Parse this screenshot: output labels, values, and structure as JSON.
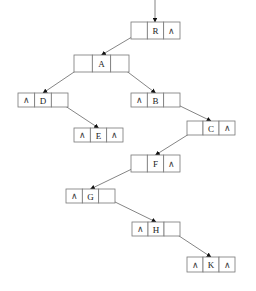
{
  "diagram": {
    "type": "binary-tree-linked-representation",
    "nil_symbol": "∧",
    "root_pointer": {
      "x": 155,
      "y1": 0,
      "y2": 22
    },
    "nodes": [
      {
        "id": "R",
        "label": "R",
        "x": 131,
        "y": 22,
        "w": 49,
        "h": 17,
        "left": "A",
        "right": null
      },
      {
        "id": "A",
        "label": "A",
        "x": 74,
        "y": 55,
        "w": 55,
        "h": 17,
        "left": "D",
        "right": "B"
      },
      {
        "id": "D",
        "label": "D",
        "x": 18,
        "y": 93,
        "w": 50,
        "h": 14,
        "left": null,
        "right": "E"
      },
      {
        "id": "B",
        "label": "B",
        "x": 131,
        "y": 93,
        "w": 49,
        "h": 14,
        "left": null,
        "right": "C"
      },
      {
        "id": "E",
        "label": "E",
        "x": 74,
        "y": 128,
        "w": 49,
        "h": 14,
        "left": null,
        "right": null
      },
      {
        "id": "C",
        "label": "C",
        "x": 187,
        "y": 121,
        "w": 48,
        "h": 14,
        "left": "F",
        "right": null
      },
      {
        "id": "F",
        "label": "F",
        "x": 131,
        "y": 155,
        "w": 49,
        "h": 17,
        "left": "G",
        "right": null
      },
      {
        "id": "G",
        "label": "G",
        "x": 66,
        "y": 189,
        "w": 49,
        "h": 14,
        "left": null,
        "right": "H"
      },
      {
        "id": "H",
        "label": "H",
        "x": 132,
        "y": 222,
        "w": 48,
        "h": 14,
        "left": null,
        "right": "K"
      },
      {
        "id": "K",
        "label": "K",
        "x": 187,
        "y": 257,
        "w": 48,
        "h": 15,
        "left": null,
        "right": null
      }
    ]
  }
}
